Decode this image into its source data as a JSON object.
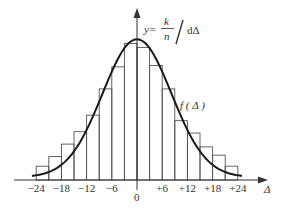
{
  "chart_data": {
    "type": "bar",
    "subtype": "histogram with fitted normal density curve",
    "title": "",
    "xlabel": "Δ",
    "ylabel": "y = (k/n) / dΔ",
    "x_ticks": [
      "-24",
      "-18",
      "-12",
      "-6",
      "0",
      "+6",
      "+12",
      "+18",
      "+24"
    ],
    "x_tick_values": [
      -24,
      -18,
      -12,
      -6,
      0,
      6,
      12,
      18,
      24
    ],
    "xlim": [
      -24,
      24
    ],
    "bin_width": 3,
    "bins": [
      {
        "from": -24,
        "to": -21,
        "height": 0.1
      },
      {
        "from": -21,
        "to": -18,
        "height": 0.17
      },
      {
        "from": -18,
        "to": -15,
        "height": 0.26
      },
      {
        "from": -15,
        "to": -12,
        "height": 0.35
      },
      {
        "from": -12,
        "to": -9,
        "height": 0.47
      },
      {
        "from": -9,
        "to": -6,
        "height": 0.66
      },
      {
        "from": -6,
        "to": -3,
        "height": 0.82
      },
      {
        "from": -3,
        "to": 0,
        "height": 0.99
      },
      {
        "from": 0,
        "to": 3,
        "height": 0.96
      },
      {
        "from": 3,
        "to": 6,
        "height": 0.83
      },
      {
        "from": 6,
        "to": 9,
        "height": 0.66
      },
      {
        "from": 9,
        "to": 12,
        "height": 0.43
      },
      {
        "from": 12,
        "to": 15,
        "height": 0.34
      },
      {
        "from": 15,
        "to": 18,
        "height": 0.24
      },
      {
        "from": 18,
        "to": 21,
        "height": 0.18
      },
      {
        "from": 21,
        "to": 24,
        "height": 0.1
      }
    ],
    "curve": {
      "label": "f(Δ)",
      "shape": "normal",
      "mean": 0,
      "peak": 1.0
    },
    "annotations": [
      "y = k/n / dΔ",
      "f ( Δ )"
    ],
    "grid": false,
    "legend": null
  },
  "labels": {
    "origin": "0",
    "x_axis": "Δ",
    "curve_label": "f ( Δ )",
    "formula_y": "y=",
    "formula_k": "k",
    "formula_n": "n",
    "formula_d": "dΔ"
  }
}
